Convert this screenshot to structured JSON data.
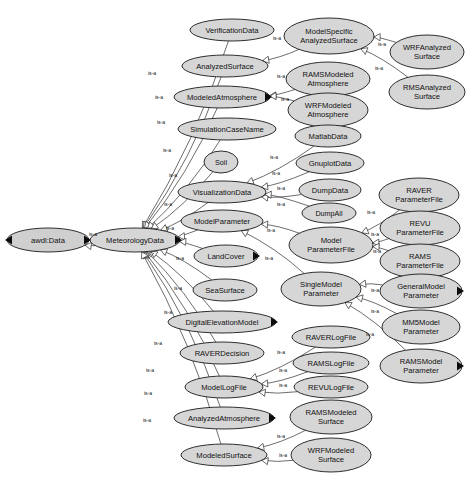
{
  "diagram": {
    "background_color": "#ffffff",
    "node_fill_color": "#d6d6d6",
    "node_stroke_color": "#1a1a1a",
    "root_node_fill_color": "#cfcfcf",
    "edge_color": "#3c3c3c",
    "edge_label_text": "is-a",
    "relation_type": "is-a"
  },
  "nodes": [
    {
      "id": "awdl-data",
      "label": "awdl:Data",
      "lines": [
        "awdl:Data"
      ],
      "cx": 48,
      "cy": 240,
      "rx": 41,
      "ry": 12,
      "handles": "both"
    },
    {
      "id": "meteorology-data",
      "label": "MeteorologyData",
      "lines": [
        "MeteorologyData"
      ],
      "cx": 135,
      "cy": 240,
      "rx": 45,
      "ry": 12,
      "handles": "right"
    },
    {
      "id": "verification-data",
      "label": "VerificationData",
      "lines": [
        "VerificationData"
      ],
      "cx": 232,
      "cy": 30,
      "rx": 42,
      "ry": 11,
      "handles": "none"
    },
    {
      "id": "analyzed-surface",
      "label": "AnalyzedSurface",
      "lines": [
        "AnalyzedSurface"
      ],
      "cx": 225,
      "cy": 66,
      "rx": 43,
      "ry": 11,
      "handles": "none"
    },
    {
      "id": "modeled-atmosphere",
      "label": "ModeledAtmosphere",
      "lines": [
        "ModeledAtmosphere"
      ],
      "cx": 222,
      "cy": 97,
      "rx": 48,
      "ry": 11,
      "handles": "right"
    },
    {
      "id": "simulation-case-name",
      "label": "SimulationCaseName",
      "lines": [
        "SimulationCaseName"
      ],
      "cx": 227,
      "cy": 129,
      "rx": 49,
      "ry": 11,
      "handles": "none"
    },
    {
      "id": "soil",
      "label": "Soil",
      "lines": [
        "Soil"
      ],
      "cx": 221,
      "cy": 162,
      "rx": 17,
      "ry": 11,
      "handles": "none"
    },
    {
      "id": "visualization-data",
      "label": "VisualizationData",
      "lines": [
        "VisualizationData"
      ],
      "cx": 222,
      "cy": 192,
      "rx": 44,
      "ry": 11,
      "handles": "none"
    },
    {
      "id": "model-parameter",
      "label": "ModelParameter",
      "lines": [
        "ModelParameter"
      ],
      "cx": 222,
      "cy": 221,
      "rx": 41,
      "ry": 11,
      "handles": "none"
    },
    {
      "id": "land-cover",
      "label": "LandCover",
      "lines": [
        "LandCover"
      ],
      "cx": 226,
      "cy": 256,
      "rx": 32,
      "ry": 11,
      "handles": "right"
    },
    {
      "id": "sea-surface",
      "label": "SeaSurface",
      "lines": [
        "SeaSurface"
      ],
      "cx": 225,
      "cy": 290,
      "rx": 32,
      "ry": 11,
      "handles": "none"
    },
    {
      "id": "digital-elevation-model",
      "label": "DigitalElevationModel",
      "lines": [
        "DigitalElevationModel"
      ],
      "cx": 222,
      "cy": 322,
      "rx": 54,
      "ry": 11,
      "handles": "right"
    },
    {
      "id": "raver-decision",
      "label": "RAVERDecision",
      "lines": [
        "RAVERDecision"
      ],
      "cx": 222,
      "cy": 353,
      "rx": 42,
      "ry": 11,
      "handles": "none"
    },
    {
      "id": "model-log-file",
      "label": "ModelLogFile",
      "lines": [
        "ModelLogFile"
      ],
      "cx": 224,
      "cy": 387,
      "rx": 39,
      "ry": 11,
      "handles": "none"
    },
    {
      "id": "analyzed-atmosphere",
      "label": "AnalyzedAtmosphere",
      "lines": [
        "AnalyzedAtmosphere"
      ],
      "cx": 224,
      "cy": 418,
      "rx": 50,
      "ry": 11,
      "handles": "right"
    },
    {
      "id": "modeled-surface",
      "label": "ModeledSurface",
      "lines": [
        "ModeledSurface"
      ],
      "cx": 224,
      "cy": 455,
      "rx": 43,
      "ry": 11,
      "handles": "none"
    },
    {
      "id": "model-specific-analyzed-surface",
      "label": "ModelSpecific AnalyzedSurface",
      "lines": [
        "ModelSpecific",
        "AnalyzedSurface"
      ],
      "cx": 329,
      "cy": 36,
      "rx": 45,
      "ry": 18,
      "handles": "none"
    },
    {
      "id": "rams-modeled-atmosphere",
      "label": "RAMSModeled Atmosphere",
      "lines": [
        "RAMSModeled",
        "Atmosphere"
      ],
      "cx": 328,
      "cy": 79,
      "rx": 42,
      "ry": 17,
      "handles": "none"
    },
    {
      "id": "wrf-modeled-atmosphere",
      "label": "WRFModeled Atmosphere",
      "lines": [
        "WRFModeled",
        "Atmosphere"
      ],
      "cx": 328,
      "cy": 110,
      "rx": 40,
      "ry": 17,
      "handles": "none"
    },
    {
      "id": "wrf-analyzed-surface",
      "label": "WRFAnalyzed Surface",
      "lines": [
        "WRFAnalyzed",
        "Surface"
      ],
      "cx": 427,
      "cy": 52,
      "rx": 37,
      "ry": 17,
      "handles": "none"
    },
    {
      "id": "rms-analyzed-surface",
      "label": "RMSAnalyzed Surface",
      "lines": [
        "RMSAnalyzed",
        "Surface"
      ],
      "cx": 427,
      "cy": 92,
      "rx": 38,
      "ry": 17,
      "handles": "none"
    },
    {
      "id": "matlab-data",
      "label": "MatlabData",
      "lines": [
        "MatlabData"
      ],
      "cx": 328,
      "cy": 136,
      "rx": 33,
      "ry": 11,
      "handles": "none"
    },
    {
      "id": "gnuplot-data",
      "label": "GnuplotData",
      "lines": [
        "GnuplotData"
      ],
      "cx": 330,
      "cy": 163,
      "rx": 34,
      "ry": 11,
      "handles": "none"
    },
    {
      "id": "dump-data",
      "label": "DumpData",
      "lines": [
        "DumpData"
      ],
      "cx": 330,
      "cy": 190,
      "rx": 31,
      "ry": 11,
      "handles": "none"
    },
    {
      "id": "dump-all",
      "label": "DumpAll",
      "lines": [
        "DumpAll"
      ],
      "cx": 329,
      "cy": 213,
      "rx": 27,
      "ry": 10,
      "handles": "none"
    },
    {
      "id": "model-parameter-file",
      "label": "Model ParameterFile",
      "lines": [
        "Model",
        "ParameterFile"
      ],
      "cx": 331,
      "cy": 245,
      "rx": 42,
      "ry": 18,
      "handles": "none"
    },
    {
      "id": "raver-parameter-file",
      "label": "RAVER ParameterFile",
      "lines": [
        "RAVER",
        "ParameterFile"
      ],
      "cx": 419,
      "cy": 195,
      "rx": 40,
      "ry": 17,
      "handles": "none"
    },
    {
      "id": "revu-parameter-file",
      "label": "REVU ParameterFile",
      "lines": [
        "REVU",
        "ParameterFile"
      ],
      "cx": 420,
      "cy": 228,
      "rx": 40,
      "ry": 17,
      "handles": "none"
    },
    {
      "id": "rams-parameter-file",
      "label": "RAMS ParameterFile",
      "lines": [
        "RAMS",
        "ParameterFile"
      ],
      "cx": 420,
      "cy": 261,
      "rx": 40,
      "ry": 17,
      "handles": "none"
    },
    {
      "id": "single-model-parameter",
      "label": "SingleModel Parameter",
      "lines": [
        "SingleModel",
        "Parameter"
      ],
      "cx": 321,
      "cy": 289,
      "rx": 40,
      "ry": 17,
      "handles": "none"
    },
    {
      "id": "general-model-parameter",
      "label": "GeneralModel Parameter",
      "lines": [
        "GeneralModel",
        "Parameter"
      ],
      "cx": 421,
      "cy": 291,
      "rx": 41,
      "ry": 17,
      "handles": "right"
    },
    {
      "id": "mm5-model-parameter",
      "label": "MM5Model Parameter",
      "lines": [
        "MM5Model",
        "Parameter"
      ],
      "cx": 421,
      "cy": 327,
      "rx": 39,
      "ry": 17,
      "handles": "none"
    },
    {
      "id": "rams-model-parameter",
      "label": "RAMSModel Parameter",
      "lines": [
        "RAMSModel",
        "Parameter"
      ],
      "cx": 421,
      "cy": 366,
      "rx": 41,
      "ry": 17,
      "handles": "right"
    },
    {
      "id": "raver-log-file",
      "label": "RAVERLogFile",
      "lines": [
        "RAVERLogFile"
      ],
      "cx": 331,
      "cy": 337,
      "rx": 39,
      "ry": 11,
      "handles": "none"
    },
    {
      "id": "rams-log-file",
      "label": "RAMSLogFile",
      "lines": [
        "RAMSLogFile"
      ],
      "cx": 331,
      "cy": 363,
      "rx": 38,
      "ry": 11,
      "handles": "none"
    },
    {
      "id": "revu-log-file",
      "label": "REVULogFile",
      "lines": [
        "REVULogFile"
      ],
      "cx": 331,
      "cy": 387,
      "rx": 37,
      "ry": 11,
      "handles": "none"
    },
    {
      "id": "rams-modeled-surface",
      "label": "RAMSModeled Surface",
      "lines": [
        "RAMSModeled",
        "Surface"
      ],
      "cx": 331,
      "cy": 417,
      "rx": 41,
      "ry": 17,
      "handles": "none"
    },
    {
      "id": "wrf-modeled-surface",
      "label": "WRFModeled Surface",
      "lines": [
        "WRFModeled",
        "Surface"
      ],
      "cx": 331,
      "cy": 455,
      "rx": 40,
      "ry": 17,
      "handles": "none"
    }
  ],
  "edges": [
    {
      "from": "meteorology-data",
      "to": "awdl-data",
      "label": "is-a",
      "lx": 93,
      "ly": 234
    },
    {
      "from": "verification-data",
      "to": "meteorology-data",
      "label": "is-a",
      "lx": 152,
      "ly": 73
    },
    {
      "from": "analyzed-surface",
      "to": "meteorology-data",
      "label": "is-a",
      "lx": 159,
      "ly": 97
    },
    {
      "from": "modeled-atmosphere",
      "to": "meteorology-data",
      "label": "is-a",
      "lx": 161,
      "ly": 122
    },
    {
      "from": "simulation-case-name",
      "to": "meteorology-data",
      "label": "is-a",
      "lx": 167,
      "ly": 150
    },
    {
      "from": "soil",
      "to": "meteorology-data",
      "label": "is-a",
      "lx": 173,
      "ly": 175
    },
    {
      "from": "visualization-data",
      "to": "meteorology-data",
      "label": "is-a",
      "lx": 168,
      "ly": 204
    },
    {
      "from": "model-parameter",
      "to": "meteorology-data",
      "label": "is-a",
      "lx": 170,
      "ly": 228
    },
    {
      "from": "land-cover",
      "to": "meteorology-data",
      "label": "is-a",
      "lx": 180,
      "ly": 258
    },
    {
      "from": "sea-surface",
      "to": "meteorology-data",
      "label": "is-a",
      "lx": 178,
      "ly": 288
    },
    {
      "from": "digital-elevation-model",
      "to": "meteorology-data",
      "label": "is-a",
      "lx": 168,
      "ly": 312
    },
    {
      "from": "raver-decision",
      "to": "meteorology-data",
      "label": "is-a",
      "lx": 158,
      "ly": 343
    },
    {
      "from": "model-log-file",
      "to": "meteorology-data",
      "label": "is-a",
      "lx": 150,
      "ly": 370
    },
    {
      "from": "analyzed-atmosphere",
      "to": "meteorology-data",
      "label": "is-a",
      "lx": 148,
      "ly": 393
    },
    {
      "from": "modeled-surface",
      "to": "meteorology-data",
      "label": "is-a",
      "lx": 147,
      "ly": 420
    },
    {
      "from": "model-specific-analyzed-surface",
      "to": "analyzed-surface",
      "label": "is-a",
      "lx": 277,
      "ly": 38
    },
    {
      "from": "rams-modeled-atmosphere",
      "to": "modeled-atmosphere",
      "label": "is-a",
      "lx": 281,
      "ly": 76
    },
    {
      "from": "wrf-modeled-atmosphere",
      "to": "modeled-atmosphere",
      "label": "is-a",
      "lx": 285,
      "ly": 99
    },
    {
      "from": "wrf-analyzed-surface",
      "to": "model-specific-analyzed-surface",
      "label": "is-a",
      "lx": 382,
      "ly": 44
    },
    {
      "from": "rms-analyzed-surface",
      "to": "model-specific-analyzed-surface",
      "label": "is-a",
      "lx": 379,
      "ly": 68
    },
    {
      "from": "matlab-data",
      "to": "visualization-data",
      "label": "is-a",
      "lx": 274,
      "ly": 157
    },
    {
      "from": "gnuplot-data",
      "to": "visualization-data",
      "label": "is-a",
      "lx": 276,
      "ly": 173
    },
    {
      "from": "dump-data",
      "to": "visualization-data",
      "label": "is-a",
      "lx": 281,
      "ly": 188
    },
    {
      "from": "dump-all",
      "to": "visualization-data",
      "label": "is-a",
      "lx": 281,
      "ly": 204
    },
    {
      "from": "model-parameter-file",
      "to": "model-parameter",
      "label": "is-a",
      "lx": 271,
      "ly": 230
    },
    {
      "from": "single-model-parameter",
      "to": "model-parameter",
      "label": "is-a",
      "lx": 269,
      "ly": 258
    },
    {
      "from": "raver-parameter-file",
      "to": "model-parameter-file",
      "label": "is-a",
      "lx": 371,
      "ly": 212
    },
    {
      "from": "revu-parameter-file",
      "to": "model-parameter-file",
      "label": "is-a",
      "lx": 375,
      "ly": 234
    },
    {
      "from": "rams-parameter-file",
      "to": "model-parameter-file",
      "label": "is-a",
      "lx": 377,
      "ly": 251
    },
    {
      "from": "general-model-parameter",
      "to": "single-model-parameter",
      "label": "is-a",
      "lx": 375,
      "ly": 290
    },
    {
      "from": "mm5-model-parameter",
      "to": "single-model-parameter",
      "label": "is-a",
      "lx": 375,
      "ly": 311
    },
    {
      "from": "rams-model-parameter",
      "to": "single-model-parameter",
      "label": "is-a",
      "lx": 370,
      "ly": 334
    },
    {
      "from": "raver-log-file",
      "to": "model-log-file",
      "label": "is-a",
      "lx": 281,
      "ly": 352
    },
    {
      "from": "rams-log-file",
      "to": "model-log-file",
      "label": "is-a",
      "lx": 283,
      "ly": 370
    },
    {
      "from": "revu-log-file",
      "to": "model-log-file",
      "label": "is-a",
      "lx": 283,
      "ly": 385
    },
    {
      "from": "rams-modeled-surface",
      "to": "modeled-surface",
      "label": "is-a",
      "lx": 281,
      "ly": 436
    },
    {
      "from": "wrf-modeled-surface",
      "to": "modeled-surface",
      "label": "is-a",
      "lx": 283,
      "ly": 455
    }
  ]
}
